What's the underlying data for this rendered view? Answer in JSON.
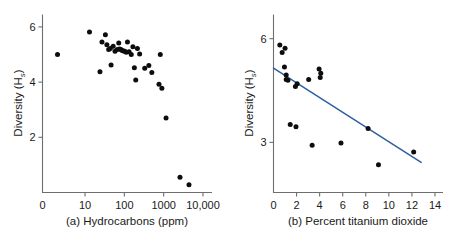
{
  "figure": {
    "background": "#ffffff",
    "point_color": "#0d0d0d",
    "axis_color": "#6e6e6e",
    "fit_line_color": "#2e5fa3"
  },
  "chart_data": [
    {
      "type": "scatter",
      "panel": "a",
      "title": "",
      "caption": "(a) Hydrocarbons (ppm)",
      "xlabel": "Hydrocarbons (ppm)",
      "ylabel": "Diversity (H",
      "ylabel_sub": "s",
      "ylabel_close": ")",
      "xscale": "log",
      "yscale": "linear",
      "xlim": [
        1.6,
        20000
      ],
      "ylim": [
        0,
        6.45
      ],
      "grid": false,
      "legend": "none",
      "xticks": [
        10,
        100,
        1000,
        10000
      ],
      "xtick_labels": [
        "10",
        "100",
        "1000",
        "10,000"
      ],
      "x_origin_label": "0",
      "yticks": [
        2,
        4,
        6
      ],
      "ytick_labels": [
        "2",
        "4",
        "6"
      ],
      "points": [
        {
          "x": 2.0,
          "y": 5.0
        },
        {
          "x": 13.0,
          "y": 5.82
        },
        {
          "x": 24.0,
          "y": 4.38
        },
        {
          "x": 27.0,
          "y": 5.45
        },
        {
          "x": 33.0,
          "y": 5.72
        },
        {
          "x": 36.0,
          "y": 5.35
        },
        {
          "x": 40.0,
          "y": 5.18
        },
        {
          "x": 44.0,
          "y": 5.22
        },
        {
          "x": 46.0,
          "y": 4.62
        },
        {
          "x": 52.0,
          "y": 5.3
        },
        {
          "x": 58.0,
          "y": 5.12
        },
        {
          "x": 66.0,
          "y": 5.18
        },
        {
          "x": 72.0,
          "y": 5.42
        },
        {
          "x": 76.0,
          "y": 5.2
        },
        {
          "x": 82.0,
          "y": 5.18
        },
        {
          "x": 88.0,
          "y": 5.15
        },
        {
          "x": 95.0,
          "y": 5.13
        },
        {
          "x": 103.0,
          "y": 5.12
        },
        {
          "x": 112.0,
          "y": 5.08
        },
        {
          "x": 120.0,
          "y": 5.45
        },
        {
          "x": 132.0,
          "y": 5.1
        },
        {
          "x": 150.0,
          "y": 5.0
        },
        {
          "x": 165.0,
          "y": 5.28
        },
        {
          "x": 180.0,
          "y": 4.52
        },
        {
          "x": 195.0,
          "y": 4.08
        },
        {
          "x": 215.0,
          "y": 5.22
        },
        {
          "x": 245.0,
          "y": 5.02
        },
        {
          "x": 330.0,
          "y": 4.5
        },
        {
          "x": 420.0,
          "y": 4.6
        },
        {
          "x": 500.0,
          "y": 4.35
        },
        {
          "x": 760.0,
          "y": 3.92
        },
        {
          "x": 820.0,
          "y": 5.0
        },
        {
          "x": 900.0,
          "y": 3.78
        },
        {
          "x": 1150.0,
          "y": 2.7
        },
        {
          "x": 2600.0,
          "y": 0.55
        },
        {
          "x": 4400.0,
          "y": 0.28
        }
      ]
    },
    {
      "type": "scatter",
      "panel": "b",
      "title": "",
      "caption": "(b) Percent titanium dioxide",
      "xlabel": "Percent titanium dioxide",
      "ylabel": "Diversity (H",
      "ylabel_sub": "s",
      "ylabel_close": ")",
      "xscale": "linear",
      "yscale": "linear",
      "xlim": [
        0,
        14.3
      ],
      "ylim": [
        1.55,
        6.7
      ],
      "grid": false,
      "legend": "none",
      "xticks": [
        0,
        2,
        4,
        6,
        8,
        10,
        12,
        14
      ],
      "xtick_labels": [
        "0",
        "2",
        "4",
        "6",
        "8",
        "10",
        "12",
        "14"
      ],
      "yticks": [
        3,
        6
      ],
      "ytick_labels": [
        "3",
        "6"
      ],
      "points": [
        {
          "x": 0.55,
          "y": 5.82
        },
        {
          "x": 0.75,
          "y": 5.6
        },
        {
          "x": 1.0,
          "y": 5.72
        },
        {
          "x": 0.95,
          "y": 5.18
        },
        {
          "x": 1.1,
          "y": 4.95
        },
        {
          "x": 1.1,
          "y": 4.82
        },
        {
          "x": 1.25,
          "y": 4.8
        },
        {
          "x": 1.45,
          "y": 3.52
        },
        {
          "x": 1.9,
          "y": 4.62
        },
        {
          "x": 1.95,
          "y": 3.45
        },
        {
          "x": 2.05,
          "y": 4.7
        },
        {
          "x": 3.05,
          "y": 4.82
        },
        {
          "x": 3.35,
          "y": 2.92
        },
        {
          "x": 3.95,
          "y": 5.12
        },
        {
          "x": 4.05,
          "y": 4.88
        },
        {
          "x": 4.1,
          "y": 5.0
        },
        {
          "x": 5.85,
          "y": 2.98
        },
        {
          "x": 8.2,
          "y": 3.4
        },
        {
          "x": 9.1,
          "y": 2.35
        },
        {
          "x": 12.15,
          "y": 2.72
        }
      ],
      "fit_line": {
        "name": "least-squares fit",
        "color": "#2e5fa3",
        "x_start": 0.0,
        "y_start": 5.15,
        "x_end": 12.8,
        "y_end": 2.42
      }
    }
  ]
}
